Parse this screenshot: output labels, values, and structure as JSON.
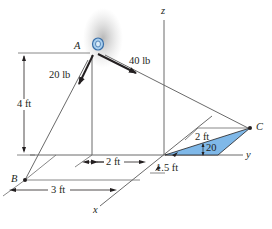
{
  "diagram": {
    "points": {
      "A": "A",
      "B": "B",
      "C": "C"
    },
    "axes": {
      "x": "x",
      "y": "y",
      "z": "z"
    },
    "forces": [
      {
        "label": "20 lb",
        "direction": "toward B"
      },
      {
        "label": "40 lb",
        "direction": "toward C"
      }
    ],
    "dimensions": {
      "height": "4 ft",
      "y_offset": "2 ft",
      "x_offset": "3 ft",
      "plate_offset": "1.5 ft",
      "plate_length": "2 ft",
      "angle": "20"
    },
    "colors": {
      "plate_fill": "#7fb8e8",
      "line": "#5a5a5a",
      "arrow": "#231f20"
    }
  }
}
